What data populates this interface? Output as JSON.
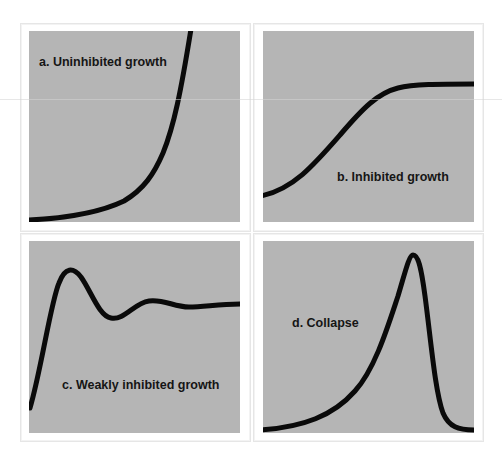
{
  "figure": {
    "panels": [
      {
        "id": "a",
        "label": "a. Uninhibited growth",
        "curve_type": "exponential",
        "background_color": "#b5b5b5",
        "curve_color": "#0a0a0a"
      },
      {
        "id": "b",
        "label": "b. Inhibited growth",
        "curve_type": "logistic",
        "background_color": "#b5b5b5",
        "curve_color": "#0a0a0a"
      },
      {
        "id": "c",
        "label": "c. Weakly inhibited growth",
        "curve_type": "damped-oscillation",
        "background_color": "#b5b5b5",
        "curve_color": "#0a0a0a"
      },
      {
        "id": "d",
        "label": "d. Collapse",
        "curve_type": "overshoot-and-collapse",
        "background_color": "#b5b5b5",
        "curve_color": "#0a0a0a"
      }
    ]
  }
}
